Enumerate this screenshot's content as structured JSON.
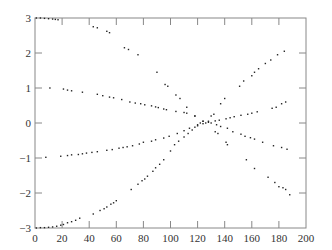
{
  "chart_data": {
    "type": "scatter",
    "title": "",
    "xlabel": "",
    "ylabel": "",
    "xlim": [
      0,
      200
    ],
    "ylim": [
      -3,
      3
    ],
    "xticks": [
      0,
      20,
      40,
      60,
      80,
      100,
      120,
      140,
      160,
      180,
      200
    ],
    "yticks": [
      -3,
      -2,
      -1,
      0,
      1,
      2,
      3
    ],
    "xtick_labels": [
      "0",
      "20",
      "40",
      "60",
      "80",
      "100",
      "120",
      "140",
      "160",
      "180",
      "200"
    ],
    "ytick_labels": [
      "−3",
      "−2",
      "−1",
      "0",
      "1",
      "2",
      "3"
    ],
    "grid": false,
    "legend": null,
    "marker_color": "#222222",
    "series": [
      {
        "name": "curve-descending-from-3",
        "points": [
          [
            1,
            3.0
          ],
          [
            4,
            3.0
          ],
          [
            7,
            2.99
          ],
          [
            10,
            2.98
          ],
          [
            13,
            2.97
          ],
          [
            15,
            2.96
          ],
          [
            17,
            2.95
          ],
          [
            43,
            2.75
          ],
          [
            46,
            2.72
          ],
          [
            53,
            2.62
          ],
          [
            55,
            2.58
          ],
          [
            66,
            2.15
          ],
          [
            69,
            2.1
          ],
          [
            76,
            1.95
          ],
          [
            90,
            1.45
          ],
          [
            96,
            1.1
          ],
          [
            98,
            1.05
          ],
          [
            104,
            0.8
          ],
          [
            107,
            0.7
          ],
          [
            112,
            0.45
          ],
          [
            118,
            0.2
          ],
          [
            124,
            0.05
          ],
          [
            126,
            0.0
          ],
          [
            133,
            -0.25
          ],
          [
            135,
            -0.3
          ],
          [
            141,
            -0.55
          ],
          [
            142,
            -0.62
          ],
          [
            156,
            -1.05
          ],
          [
            162,
            -1.3
          ],
          [
            172,
            -1.55
          ],
          [
            177,
            -1.7
          ],
          [
            180,
            -1.82
          ],
          [
            183,
            -1.85
          ],
          [
            185,
            -1.9
          ],
          [
            188,
            -2.05
          ]
        ]
      },
      {
        "name": "curve-ascending-from-minus-3",
        "points": [
          [
            1,
            -3.0
          ],
          [
            4,
            -2.99
          ],
          [
            7,
            -2.99
          ],
          [
            10,
            -2.98
          ],
          [
            13,
            -2.97
          ],
          [
            16,
            -2.95
          ],
          [
            19,
            -2.92
          ],
          [
            21,
            -2.9
          ],
          [
            24,
            -2.85
          ],
          [
            27,
            -2.82
          ],
          [
            30,
            -2.78
          ],
          [
            33,
            -2.72
          ],
          [
            43,
            -2.6
          ],
          [
            48,
            -2.5
          ],
          [
            51,
            -2.45
          ],
          [
            53,
            -2.4
          ],
          [
            56,
            -2.32
          ],
          [
            58,
            -2.28
          ],
          [
            60,
            -2.22
          ],
          [
            71,
            -1.9
          ],
          [
            76,
            -1.75
          ],
          [
            79,
            -1.65
          ],
          [
            81,
            -1.6
          ],
          [
            83,
            -1.52
          ],
          [
            87,
            -1.38
          ],
          [
            89,
            -1.28
          ],
          [
            92,
            -1.18
          ],
          [
            95,
            -1.05
          ],
          [
            100,
            -0.8
          ],
          [
            103,
            -0.62
          ],
          [
            106,
            -0.52
          ],
          [
            110,
            -0.4
          ],
          [
            113,
            -0.3
          ],
          [
            116,
            -0.2
          ],
          [
            118,
            -0.12
          ],
          [
            120,
            -0.05
          ],
          [
            122,
            0.0
          ],
          [
            124,
            0.05
          ],
          [
            130,
            0.2
          ],
          [
            132,
            0.25
          ],
          [
            137,
            0.55
          ],
          [
            140,
            0.7
          ],
          [
            151,
            1.05
          ],
          [
            154,
            1.2
          ],
          [
            160,
            1.35
          ],
          [
            162,
            1.45
          ],
          [
            165,
            1.55
          ],
          [
            170,
            1.7
          ],
          [
            174,
            1.8
          ],
          [
            179,
            1.95
          ],
          [
            184,
            2.05
          ]
        ]
      },
      {
        "name": "curve-descending-from-1",
        "points": [
          [
            11,
            1.0
          ],
          [
            21,
            0.97
          ],
          [
            24,
            0.94
          ],
          [
            27,
            0.92
          ],
          [
            35,
            0.88
          ],
          [
            46,
            0.82
          ],
          [
            50,
            0.78
          ],
          [
            55,
            0.74
          ],
          [
            58,
            0.72
          ],
          [
            64,
            0.67
          ],
          [
            70,
            0.6
          ],
          [
            74,
            0.57
          ],
          [
            78,
            0.55
          ],
          [
            81,
            0.52
          ],
          [
            86,
            0.49
          ],
          [
            89,
            0.46
          ],
          [
            91,
            0.44
          ],
          [
            95,
            0.4
          ],
          [
            97,
            0.38
          ],
          [
            104,
            0.33
          ],
          [
            110,
            0.3
          ],
          [
            112,
            0.28
          ],
          [
            118,
            0.2
          ],
          [
            128,
            0.05
          ],
          [
            130,
            0.0
          ],
          [
            134,
            -0.05
          ],
          [
            137,
            -0.1
          ],
          [
            142,
            -0.15
          ],
          [
            146,
            -0.25
          ],
          [
            152,
            -0.32
          ],
          [
            155,
            -0.38
          ],
          [
            159,
            -0.42
          ],
          [
            162,
            -0.46
          ],
          [
            168,
            -0.55
          ],
          [
            176,
            -0.65
          ],
          [
            182,
            -0.7
          ],
          [
            186,
            -0.75
          ]
        ]
      },
      {
        "name": "curve-ascending-from-minus-1",
        "points": [
          [
            8,
            -0.98
          ],
          [
            19,
            -0.95
          ],
          [
            24,
            -0.93
          ],
          [
            27,
            -0.91
          ],
          [
            32,
            -0.9
          ],
          [
            35,
            -0.88
          ],
          [
            38,
            -0.86
          ],
          [
            42,
            -0.84
          ],
          [
            46,
            -0.82
          ],
          [
            53,
            -0.78
          ],
          [
            57,
            -0.76
          ],
          [
            62,
            -0.72
          ],
          [
            65,
            -0.7
          ],
          [
            68,
            -0.68
          ],
          [
            72,
            -0.65
          ],
          [
            77,
            -0.6
          ],
          [
            80,
            -0.55
          ],
          [
            86,
            -0.52
          ],
          [
            89,
            -0.48
          ],
          [
            95,
            -0.43
          ],
          [
            99,
            -0.38
          ],
          [
            105,
            -0.3
          ],
          [
            110,
            -0.22
          ],
          [
            114,
            -0.15
          ],
          [
            120,
            -0.08
          ],
          [
            124,
            -0.02
          ],
          [
            128,
            0.02
          ],
          [
            133,
            0.06
          ],
          [
            136,
            0.08
          ],
          [
            141,
            0.12
          ],
          [
            144,
            0.15
          ],
          [
            147,
            0.18
          ],
          [
            152,
            0.22
          ],
          [
            157,
            0.25
          ],
          [
            160,
            0.28
          ],
          [
            164,
            0.32
          ],
          [
            175,
            0.42
          ],
          [
            178,
            0.45
          ],
          [
            182,
            0.55
          ],
          [
            185,
            0.6
          ]
        ]
      }
    ]
  }
}
